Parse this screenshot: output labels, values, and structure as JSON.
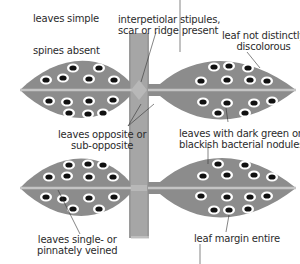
{
  "diagram": {
    "type": "botanical-leaf-characteristics",
    "colors": {
      "leaf": "#8c8c8c",
      "midrib": "#c4c4c4",
      "stem": "#a6a6a6",
      "stem_edge": "#8e8e8e",
      "stipule": "#b8b8b8",
      "nodule": "#111111",
      "nodule_ring": "#ffffff",
      "leader_line": "#333333"
    },
    "labels": {
      "leaves_simple": "leaves simple",
      "spines_absent": "spines absent",
      "interpetiolar_line1": "interpetiolar stipules,",
      "interpetiolar_line2": "scar or ridge present",
      "discolorous_line1": "leaf not distinctly",
      "discolorous_line2": "discolorous",
      "opposite_line1": "leaves opposite or",
      "opposite_line2": "sub-opposite",
      "nodules_line1": "leaves with dark green or",
      "nodules_line2": "blackish bacterial nodules",
      "veined_line1": "leaves single- or",
      "veined_line2": "pinnately veined",
      "margin": "leaf margin entire"
    }
  }
}
